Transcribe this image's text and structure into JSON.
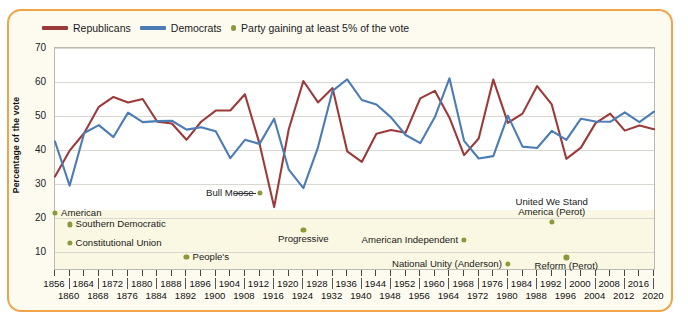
{
  "legend": {
    "republicans": "Republicans",
    "democrats": "Democrats",
    "third_party": "Party gaining at least 5% of the vote"
  },
  "axes": {
    "ylabel": "Percentage of the vote",
    "yticks": [
      70,
      60,
      50,
      40,
      30,
      20,
      10
    ],
    "ylim": [
      5,
      70
    ],
    "xlim": [
      1856,
      2020
    ],
    "xticks_top": [
      1856,
      1864,
      1872,
      1880,
      1888,
      1896,
      1904,
      1912,
      1920,
      1928,
      1936,
      1944,
      1952,
      1960,
      1968,
      1976,
      1984,
      1992,
      2000,
      2008,
      2016
    ],
    "xticks_bottom": [
      1860,
      1868,
      1876,
      1884,
      1892,
      1900,
      1908,
      1916,
      1924,
      1932,
      1940,
      1948,
      1956,
      1964,
      1972,
      1980,
      1988,
      1996,
      2004,
      2012,
      2020
    ]
  },
  "colors": {
    "republican": "#9c3a3a",
    "democrat": "#4b7cb5",
    "third_party": "#8a9a3b",
    "border": "#f0a448",
    "panel": "#fdfbf0",
    "lower_band": "#faf7e2"
  },
  "chart_data": {
    "type": "line",
    "title": "",
    "xlabel": "",
    "ylabel": "Percentage of the vote",
    "ylim": [
      5,
      70
    ],
    "grid": true,
    "legend_position": "top-left",
    "x": [
      1856,
      1860,
      1864,
      1868,
      1872,
      1876,
      1880,
      1884,
      1888,
      1892,
      1896,
      1900,
      1904,
      1908,
      1912,
      1916,
      1920,
      1924,
      1928,
      1932,
      1936,
      1940,
      1944,
      1948,
      1952,
      1956,
      1960,
      1964,
      1968,
      1972,
      1976,
      1980,
      1984,
      1988,
      1992,
      1996,
      2000,
      2004,
      2008,
      2012,
      2016,
      2020
    ],
    "series": [
      {
        "name": "Republicans",
        "color": "#9c3a3a",
        "values": [
          32.2,
          39.8,
          45.0,
          52.7,
          55.6,
          54.0,
          55.0,
          48.3,
          47.8,
          43.0,
          48.3,
          51.6,
          51.6,
          56.4,
          41.8,
          23.2,
          46.1,
          60.3,
          54.0,
          58.2,
          39.6,
          36.5,
          44.8,
          45.9,
          45.1,
          55.2,
          57.4,
          49.5,
          38.5,
          43.4,
          60.7,
          48.0,
          50.7,
          58.8,
          53.4,
          37.4,
          40.7,
          47.9,
          50.7,
          45.7,
          47.2,
          46.1
        ]
      },
      {
        "name": "Democrats",
        "color": "#4b7cb5",
        "values": [
          42.5,
          29.5,
          45.0,
          47.3,
          43.8,
          51.0,
          48.2,
          48.5,
          48.6,
          46.0,
          46.7,
          45.5,
          37.6,
          43.0,
          41.8,
          49.2,
          34.2,
          28.8,
          40.8,
          57.4,
          60.8,
          54.7,
          53.4,
          49.6,
          44.4,
          42.0,
          49.7,
          61.1,
          42.7,
          37.5,
          38.2,
          50.1,
          41.0,
          40.6,
          45.6,
          43.0,
          49.2,
          48.4,
          48.3,
          51.1,
          48.2,
          51.3
        ]
      }
    ],
    "third_party_points": [
      {
        "label": "American",
        "year": 1856,
        "value": 21.5,
        "label_side": "right"
      },
      {
        "label": "Southern Democratic",
        "year": 1860,
        "value": 18.1,
        "label_side": "right"
      },
      {
        "label": "Constitutional Union",
        "year": 1860,
        "value": 12.6,
        "label_side": "right"
      },
      {
        "label": "People's",
        "year": 1892,
        "value": 8.5,
        "label_side": "right"
      },
      {
        "label": "Bull Moose",
        "year": 1912,
        "value": 27.4,
        "label_side": "left"
      },
      {
        "label": "Progressive",
        "year": 1924,
        "value": 16.6,
        "label_side": "below"
      },
      {
        "label": "American Independent",
        "year": 1968,
        "value": 13.5,
        "label_side": "left"
      },
      {
        "label": "National Unity (Anderson)",
        "year": 1980,
        "value": 6.6,
        "label_side": "left"
      },
      {
        "label": "Reform (Perot)",
        "year": 1996,
        "value": 8.4,
        "label_side": "below"
      },
      {
        "label": "United We Stand America (Perot)",
        "year": 1992,
        "value": 18.9,
        "label_side": "above"
      }
    ]
  }
}
